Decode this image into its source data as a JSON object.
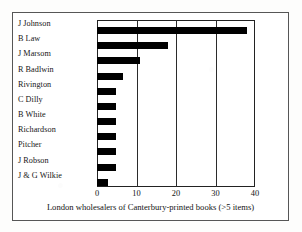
{
  "chart_data": {
    "type": "bar",
    "orientation": "horizontal",
    "title": "",
    "xlabel": "London wholesalers of Canterbury-printed books (>5 items)",
    "ylabel": "",
    "categories": [
      "J Johnson",
      "B Law",
      "J Marsom",
      "R Badlwin",
      "Rivington",
      "C Dilly",
      "B White",
      "Richardson",
      "Pitcher",
      "J Robson",
      "J & G Wilkie"
    ],
    "values": [
      38,
      18,
      11,
      6.5,
      4.7,
      4.7,
      4.7,
      4.7,
      4.7,
      4.7,
      2.8
    ],
    "xlim": [
      0,
      40
    ],
    "xticks": [
      0,
      10,
      20,
      30,
      40
    ],
    "xticklabels": [
      "0",
      "10",
      "20",
      "30",
      "40"
    ],
    "grid": true,
    "legend": false,
    "bar_color": "#000000",
    "frame_color": "#222222"
  },
  "figure": {
    "caption": "London wholesalers of Canterbury-printed books (>5 items)"
  }
}
